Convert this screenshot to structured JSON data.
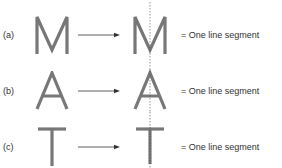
{
  "figure": {
    "rows": [
      {
        "label": "(a)",
        "letter": "M",
        "description": "= One line segment"
      },
      {
        "label": "(b)",
        "letter": "A",
        "description": "= One line segment"
      },
      {
        "label": "(c)",
        "letter": "T",
        "description": "= One line segment"
      }
    ],
    "colors": {
      "letter": "#777777",
      "arrow": "#333333",
      "symmetry_line": "#555555"
    }
  }
}
